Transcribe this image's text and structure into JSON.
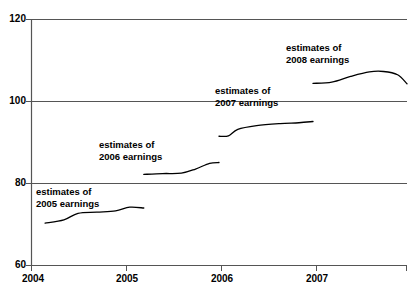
{
  "chart_data": {
    "type": "line",
    "title": "",
    "xlabel": "",
    "ylabel": "",
    "xlim": [
      2004,
      2008.0
    ],
    "ylim": [
      60,
      120
    ],
    "yticks": [
      60,
      80,
      100,
      120
    ],
    "xticks": [
      2004,
      2005,
      2006,
      2007
    ],
    "grid": true,
    "grid_axis": "y",
    "legend": "inline-annotations",
    "line_color": "#000000",
    "series": [
      {
        "name": "estimates of 2005 earnings",
        "annotation": [
          "estimates of",
          "2005 earnings"
        ],
        "x": [
          2004.15,
          2004.35,
          2004.5,
          2004.7,
          2004.9,
          2005.05,
          2005.2
        ],
        "values": [
          70.2,
          71.0,
          72.6,
          72.9,
          73.2,
          74.1,
          73.9
        ]
      },
      {
        "name": "estimates of 2006 earnings",
        "annotation": [
          "estimates of",
          "2006 earnings"
        ],
        "x": [
          2005.2,
          2005.4,
          2005.6,
          2005.75,
          2005.9,
          2006.0
        ],
        "values": [
          82.1,
          82.3,
          82.4,
          83.4,
          84.8,
          85.0
        ]
      },
      {
        "name": "estimates of 2007 earnings",
        "annotation": [
          "estimates of",
          "2007 earnings"
        ],
        "x": [
          2006.0,
          2006.1,
          2006.2,
          2006.4,
          2006.65,
          2006.85,
          2007.0
        ],
        "values": [
          91.4,
          91.5,
          93.1,
          94.0,
          94.5,
          94.7,
          95.0
        ]
      },
      {
        "name": "estimates of 2008 earnings",
        "annotation": [
          "estimates of",
          "2008 earnings"
        ],
        "x": [
          2007.0,
          2007.2,
          2007.4,
          2007.6,
          2007.75,
          2007.9,
          2008.0
        ],
        "values": [
          104.3,
          104.6,
          106.0,
          107.1,
          107.2,
          106.4,
          104.2
        ]
      }
    ]
  },
  "axis": {
    "y_tick_labels": [
      "120",
      "100",
      "80",
      "60"
    ],
    "x_tick_labels": [
      "2004",
      "2005",
      "2006",
      "2007"
    ]
  },
  "annotations": [
    {
      "line1": "estimates of",
      "line2": "2005 earnings"
    },
    {
      "line1": "estimates of",
      "line2": "2006 earnings"
    },
    {
      "line1": "estimates of",
      "line2": "2007 earnings"
    },
    {
      "line1": "estimates of",
      "line2": "2008 earnings"
    }
  ]
}
